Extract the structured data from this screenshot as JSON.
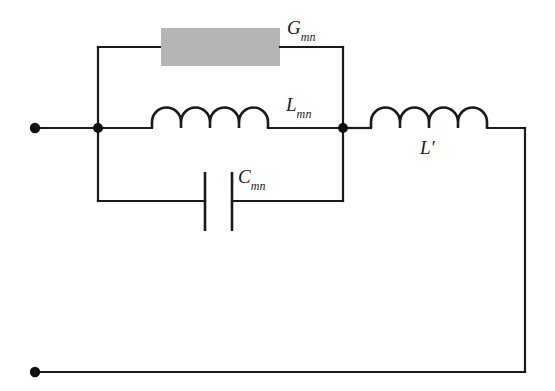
{
  "figure": {
    "type": "circuit-diagram",
    "background_color": "#ffffff",
    "wire_color": "#1a1a1a",
    "resistor_fill_color": "#b4b4b4"
  },
  "components": {
    "conductance": {
      "symbol_base": "G",
      "symbol_sub": "mn",
      "kind": "resistor-block",
      "branch": "top"
    },
    "inductance_mutual": {
      "symbol_base": "L",
      "symbol_sub": "mn",
      "kind": "inductor-coil",
      "coil_humps": 4,
      "branch": "middle"
    },
    "capacitance": {
      "symbol_base": "C",
      "symbol_sub": "mn",
      "kind": "capacitor-plates",
      "plates": 2,
      "branch": "bottom"
    },
    "inductance_series": {
      "symbol_base": "L",
      "symbol_sub": "",
      "symbol_prime": "′",
      "kind": "inductor-coil",
      "coil_humps": 4,
      "branch": "series-right"
    }
  },
  "terminals": [
    {
      "name": "input-terminal-top",
      "x": 35,
      "y": 128
    },
    {
      "name": "input-terminal-bottom",
      "x": 35,
      "y": 372
    }
  ],
  "nodes": [
    {
      "name": "left-junction-node",
      "x": 98,
      "y": 128
    },
    {
      "name": "right-junction-node",
      "x": 343,
      "y": 128
    }
  ],
  "labels": {
    "g_mn": {
      "base": "G",
      "sub": "mn"
    },
    "l_mn": {
      "base": "L",
      "sub": "mn"
    },
    "c_mn": {
      "base": "C",
      "sub": "mn"
    },
    "l_prime": {
      "base": "L",
      "prime": "′"
    }
  }
}
